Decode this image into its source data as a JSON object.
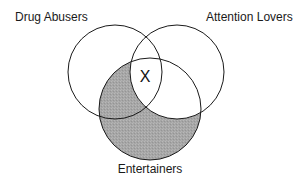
{
  "diagram": {
    "type": "venn",
    "sets": [
      {
        "id": "drug-abusers",
        "label": "Drug Abusers",
        "cx": 115,
        "cy": 72,
        "r": 47
      },
      {
        "id": "attention-lovers",
        "label": "Attention Lovers",
        "cx": 177,
        "cy": 72,
        "r": 47
      },
      {
        "id": "entertainers",
        "label": "Entertainers",
        "cx": 150,
        "cy": 109,
        "r": 51
      }
    ],
    "shaded_region": "Entertainers minus Attention Lovers",
    "marker": {
      "label": "X",
      "region": "Drug Abusers ∩ Attention Lovers ∩ Entertainers"
    },
    "colors": {
      "shade": "#a9a9a9",
      "stroke": "#1a1a1a",
      "background": "#ffffff"
    }
  }
}
